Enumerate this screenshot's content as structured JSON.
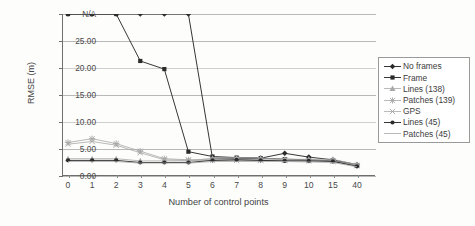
{
  "chart_data": {
    "type": "line",
    "title": "",
    "subtitle": "",
    "xlabel": "Number of control points",
    "ylabel": "RMSE (m)",
    "categories": [
      "0",
      "1",
      "2",
      "3",
      "4",
      "5",
      "6",
      "7",
      "8",
      "9",
      "10",
      "15",
      "40"
    ],
    "ylim": [
      0,
      30
    ],
    "ytick_labels": [
      "0.00",
      "5.00",
      "10.00",
      "15.00",
      "20.00",
      "25.00",
      "N/A"
    ],
    "ytick_values": [
      0,
      5,
      10,
      15,
      20,
      25,
      30
    ],
    "na_value": 30,
    "na_label": "N/A",
    "grid": "horizontal",
    "legend_position": "right",
    "series": [
      {
        "name": "No frames",
        "marker": "diamond",
        "values": [
          30,
          30,
          30,
          30,
          30,
          30,
          3.0,
          3.0,
          3.0,
          3.9,
          3.2,
          2.7,
          1.8
        ]
      },
      {
        "name": "Frame",
        "marker": "square",
        "values": [
          30,
          30,
          30,
          21.3,
          19.8,
          4.3,
          3.4,
          3.2,
          3.1,
          2.9,
          2.8,
          2.6,
          1.8
        ]
      },
      {
        "name": "Lines (138)",
        "marker": "triangle",
        "values": [
          3.1,
          3.1,
          3.1,
          2.7,
          2.7,
          2.7,
          3.2,
          3.3,
          3.2,
          3.0,
          3.0,
          3.0,
          2.0
        ]
      },
      {
        "name": "Patches (139)",
        "marker": "star",
        "values": [
          6.2,
          6.9,
          6.0,
          4.6,
          3.2,
          3.0,
          3.1,
          3.1,
          3.0,
          3.0,
          2.9,
          2.8,
          2.0
        ]
      },
      {
        "name": "GPS",
        "marker": "cross",
        "values": [
          6.0,
          6.5,
          5.8,
          4.4,
          3.1,
          3.0,
          3.0,
          3.0,
          3.0,
          3.0,
          2.9,
          2.8,
          2.0
        ]
      },
      {
        "name": "Lines (45)",
        "marker": "circle",
        "values": [
          3.1,
          3.1,
          3.1,
          2.7,
          2.7,
          2.7,
          3.1,
          3.2,
          3.1,
          3.0,
          3.0,
          2.9,
          2.0
        ]
      },
      {
        "name": "Patches (45)",
        "marker": "none",
        "values": [
          3.0,
          3.0,
          3.0,
          2.7,
          2.7,
          2.7,
          3.0,
          3.0,
          3.0,
          3.0,
          2.9,
          2.8,
          2.0
        ]
      }
    ]
  },
  "legend": {
    "items": [
      {
        "label": "No frames",
        "marker": "diamond"
      },
      {
        "label": "Frame",
        "marker": "square"
      },
      {
        "label": "Lines (138)",
        "marker": "triangle"
      },
      {
        "label": "Patches (139)",
        "marker": "star"
      },
      {
        "label": "GPS",
        "marker": "cross"
      },
      {
        "label": "Lines (45)",
        "marker": "circle"
      },
      {
        "label": "Patches (45)",
        "marker": "none"
      }
    ]
  },
  "colors": {
    "axis": "#6f6f6f",
    "grid": "#b9b9b9",
    "dark_series": "#2b2b2b",
    "light_series": "#a8a8a8",
    "text": "#3c3c3c",
    "background": "#ffffff"
  }
}
